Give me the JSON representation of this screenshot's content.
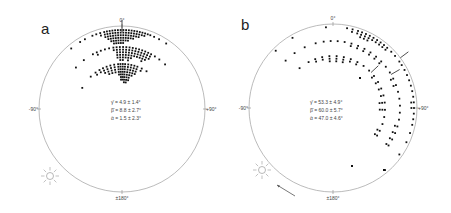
{
  "figure": {
    "panels": [
      {
        "id": "a",
        "letter": "a",
        "center": [
          122,
          109
        ],
        "radius": 83,
        "letter_pos": [
          41,
          34
        ],
        "axis_labels": {
          "top": "0°",
          "left": "-90°",
          "right": "+90°",
          "bottom": "±180°"
        },
        "stats": [
          "γ̄ = 4.9 ± 1.4°",
          "β̄ = 8.8 ± 2.7°",
          "ᾱ = 1.5 ± 2.3°"
        ],
        "stats_pos": [
          111,
          104
        ],
        "sun": [
          50,
          176
        ],
        "arrow": null
      },
      {
        "id": "b",
        "letter": "b",
        "center": [
          333,
          108
        ],
        "radius": 84,
        "letter_pos": [
          241,
          30
        ],
        "axis_labels": {
          "top": "0°",
          "left": "-90°",
          "right": "+90°",
          "bottom": "±180°"
        },
        "stats": [
          "γ̄ = 53.3 ± 4.9°",
          "β̄ = 60.0 ± 5.7°",
          "ᾱ = 47.0 ± 4.6°"
        ],
        "stats_pos": [
          310,
          104
        ],
        "sun": [
          262,
          170
        ],
        "arrow": [
          [
            295,
            196
          ],
          [
            277,
            185
          ]
        ]
      }
    ]
  },
  "chart_data": [
    {
      "type": "scatter",
      "title": "a",
      "subtype": "circular orientation plot (polar, 0° top, ±90° sides, ±180° bottom)",
      "axis_labels": [
        "0°",
        "-90°",
        "+90°",
        "±180°"
      ],
      "series": [
        {
          "name": "γ (outer ring)",
          "mean_deg": 4.9,
          "sd_deg": 1.4,
          "ring_radius_frac": 0.97
        },
        {
          "name": "β (middle ring)",
          "mean_deg": 8.8,
          "sd_deg": 2.7,
          "ring_radius_frac": 0.75
        },
        {
          "name": "α (inner ring)",
          "mean_deg": 1.5,
          "sd_deg": 2.3,
          "ring_radius_frac": 0.55
        }
      ],
      "annotations": [
        "γ̄ = 4.9 ± 1.4°",
        "β̄ = 8.8 ± 2.7°",
        "ᾱ = 1.5 ± 2.3°"
      ],
      "clusters": [
        {
          "ring_r": 79,
          "angles": [
            -40,
            -32,
            -28,
            -22,
            -19,
            -16,
            -13,
            -11,
            -9,
            -7,
            -5,
            -3,
            -1,
            1,
            3,
            5,
            7,
            9,
            11,
            13,
            15,
            17,
            19,
            21,
            24,
            28,
            34
          ],
          "stack": [
            1,
            1,
            1,
            1,
            1,
            2,
            3,
            4,
            5,
            6,
            6,
            6,
            6,
            6,
            5,
            5,
            4,
            4,
            3,
            3,
            2,
            2,
            1,
            1,
            1,
            1,
            1
          ]
        },
        {
          "ring_r": 62,
          "angles": [
            -48,
            -38,
            -28,
            -24,
            -20,
            -16,
            -12,
            -8,
            -5,
            -2,
            1,
            4,
            7,
            10,
            13,
            16,
            19,
            22,
            25,
            28,
            32,
            37,
            44
          ],
          "stack": [
            1,
            1,
            1,
            2,
            1,
            1,
            1,
            2,
            5,
            6,
            6,
            5,
            6,
            5,
            4,
            4,
            4,
            5,
            4,
            3,
            1,
            1,
            1
          ]
        },
        {
          "ring_r": 45,
          "angles": [
            -62,
            -44,
            -36,
            -30,
            -25,
            -20,
            -15,
            -10,
            -5,
            -2,
            1,
            4,
            8,
            12,
            16,
            20,
            26,
            33
          ],
          "stack": [
            1,
            1,
            2,
            2,
            3,
            4,
            4,
            4,
            5,
            7,
            7,
            8,
            8,
            7,
            5,
            4,
            2,
            1
          ]
        }
      ]
    },
    {
      "type": "scatter",
      "title": "b",
      "subtype": "circular orientation plot (polar, 0° top, ±90° sides, ±180° bottom)",
      "axis_labels": [
        "0°",
        "-90°",
        "+90°",
        "±180°"
      ],
      "series": [
        {
          "name": "γ (outer ring)",
          "mean_deg": 53.3,
          "sd_deg": 4.9,
          "ring_radius_frac": 0.97
        },
        {
          "name": "β (middle ring)",
          "mean_deg": 60.0,
          "sd_deg": 5.7,
          "ring_radius_frac": 0.8
        },
        {
          "name": "α (inner ring)",
          "mean_deg": 47.0,
          "sd_deg": 4.6,
          "ring_radius_frac": 0.62
        }
      ],
      "annotations": [
        "γ̄ = 53.3 ± 4.9°",
        "β̄ = 60.0 ± 5.7°",
        "ᾱ = 47.0 ± 4.6°"
      ],
      "clusters": [
        {
          "ring_r": 81,
          "angles": [
            -45,
            -30,
            -5,
            10,
            14,
            18,
            21,
            24,
            27,
            30,
            33,
            36,
            39,
            42,
            46,
            50,
            55,
            58,
            62,
            66,
            70,
            74,
            78,
            82,
            86,
            90,
            94,
            98,
            102,
            108,
            115,
            125,
            140
          ],
          "stack": [
            1,
            1,
            1,
            1,
            2,
            2,
            3,
            3,
            3,
            2,
            2,
            2,
            2,
            2,
            1,
            1,
            1,
            1,
            1,
            1,
            1,
            1,
            1,
            1,
            2,
            2,
            1,
            1,
            1,
            1,
            1,
            1,
            1
          ]
        },
        {
          "ring_r": 67,
          "angles": [
            -45,
            -35,
            -25,
            -15,
            -8,
            -2,
            4,
            10,
            16,
            22,
            28,
            34,
            40,
            46,
            52,
            58,
            64,
            70,
            76,
            82,
            88,
            94,
            100,
            106,
            112,
            118,
            124
          ],
          "stack": [
            1,
            1,
            1,
            1,
            1,
            1,
            1,
            1,
            2,
            2,
            2,
            2,
            2,
            2,
            1,
            1,
            2,
            2,
            1,
            1,
            1,
            1,
            1,
            2,
            2,
            2,
            2
          ]
        },
        {
          "ring_r": 52,
          "angles": [
            -40,
            -28,
            -20,
            -12,
            -4,
            4,
            12,
            20,
            28,
            36,
            44,
            52,
            60,
            68,
            76,
            84,
            92,
            100,
            108,
            116,
            122
          ],
          "stack": [
            1,
            1,
            2,
            2,
            3,
            3,
            3,
            2,
            2,
            1,
            1,
            2,
            2,
            2,
            2,
            3,
            3,
            1,
            1,
            2,
            2
          ]
        }
      ],
      "extra_points": [
        [
          352,
          166
        ],
        [
          384,
          170
        ],
        [
          360,
          78
        ]
      ]
    }
  ]
}
